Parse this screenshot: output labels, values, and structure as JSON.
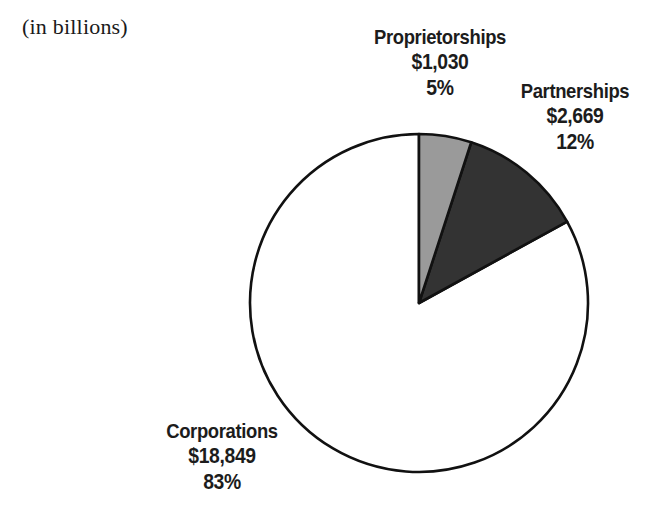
{
  "caption": "(in billions)",
  "chart_data": {
    "type": "pie",
    "title": "",
    "subtitle": "(in billions)",
    "units": "billions of dollars",
    "start_angle_deg": 0,
    "direction": "clockwise",
    "legend_position": "callout-labels",
    "grid": false,
    "categories": [
      "Proprietorships",
      "Partnerships",
      "Corporations"
    ],
    "values": [
      1030,
      2669,
      18849
    ],
    "percentages": [
      5,
      12,
      83
    ],
    "value_labels": [
      "$1,030",
      "$2,669",
      "$18,849"
    ],
    "percent_labels": [
      "5%",
      "12%",
      "83%"
    ],
    "colors": [
      "#9a9a9a",
      "#333333",
      "#ffffff"
    ],
    "outline_color": "#111111",
    "slices": [
      {
        "name": "Proprietorships",
        "value": 1030,
        "value_label": "$1,030",
        "percent": 5,
        "percent_label": "5%",
        "color": "#9a9a9a"
      },
      {
        "name": "Partnerships",
        "value": 2669,
        "value_label": "$2,669",
        "percent": 12,
        "percent_label": "12%",
        "color": "#333333"
      },
      {
        "name": "Corporations",
        "value": 18849,
        "value_label": "$18,849",
        "percent": 83,
        "percent_label": "83%",
        "color": "#ffffff"
      }
    ]
  }
}
